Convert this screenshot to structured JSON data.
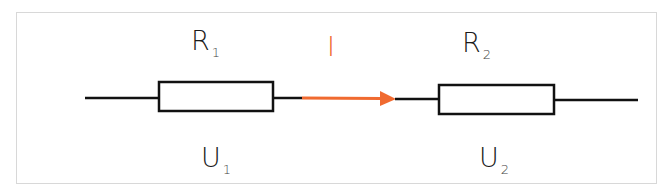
{
  "diagram": {
    "type": "series circuit",
    "colors": {
      "wire": "#111111",
      "current": "#f06a30",
      "frame": "#d8d8d8"
    },
    "resistors": [
      {
        "name": "R",
        "subscript": "1",
        "voltage_name": "U",
        "voltage_subscript": "1"
      },
      {
        "name": "R",
        "subscript": "2",
        "voltage_name": "U",
        "voltage_subscript": "2"
      }
    ],
    "current": {
      "label": "I",
      "direction": "right"
    }
  }
}
